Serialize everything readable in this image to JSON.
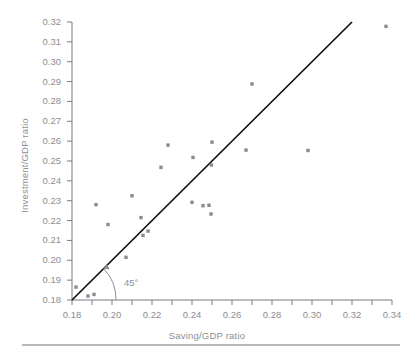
{
  "figure": {
    "background": "#ffffff",
    "point_color": "#8a8a96",
    "line_color": "#111111",
    "tick_color": "#7b7b83",
    "label_color": "#8e8e96",
    "rule_color": "#b9b9bd"
  },
  "annotation": {
    "angle_label": "45°"
  },
  "chart_data": {
    "type": "scatter",
    "title": "",
    "xlabel": "Saving/GDP ratio",
    "ylabel": "Investment/GDP ratio",
    "xlim": [
      0.18,
      0.34
    ],
    "ylim": [
      0.18,
      0.32
    ],
    "xticks": [
      0.18,
      0.19,
      0.2,
      0.21,
      0.22,
      0.23,
      0.24,
      0.25,
      0.26,
      0.27,
      0.28,
      0.29,
      0.3,
      0.31,
      0.32,
      0.33,
      0.34
    ],
    "xtick_labels": [
      "0.18",
      "",
      "0.20",
      "",
      "0.22",
      "",
      "0.24",
      "",
      "0.26",
      "",
      "0.28",
      "",
      "0.30",
      "",
      "0.32",
      "",
      "0.34"
    ],
    "yticks": [
      0.18,
      0.19,
      0.2,
      0.21,
      0.22,
      0.23,
      0.24,
      0.25,
      0.26,
      0.27,
      0.28,
      0.29,
      0.3,
      0.31,
      0.32
    ],
    "ytick_labels": [
      "0.18",
      "0.19",
      "0.20",
      "0.21",
      "0.22",
      "0.23",
      "0.24",
      "0.25",
      "0.26",
      "0.27",
      "0.28",
      "0.29",
      "0.30",
      "0.31",
      "0.32"
    ],
    "grid": false,
    "legend": null,
    "reference_line": {
      "label": "45°",
      "slope": 1,
      "intercept": 0,
      "x_start": 0.18,
      "y_start": 0.18,
      "x_end": 0.32,
      "y_end": 0.32
    },
    "points": [
      {
        "x": 0.182,
        "y": 0.1865
      },
      {
        "x": 0.188,
        "y": 0.182
      },
      {
        "x": 0.191,
        "y": 0.1828
      },
      {
        "x": 0.192,
        "y": 0.228
      },
      {
        "x": 0.198,
        "y": 0.218
      },
      {
        "x": 0.207,
        "y": 0.2015
      },
      {
        "x": 0.21,
        "y": 0.2325
      },
      {
        "x": 0.2145,
        "y": 0.2215
      },
      {
        "x": 0.2155,
        "y": 0.2125
      },
      {
        "x": 0.218,
        "y": 0.2147
      },
      {
        "x": 0.2245,
        "y": 0.2468
      },
      {
        "x": 0.228,
        "y": 0.258
      },
      {
        "x": 0.24,
        "y": 0.2292
      },
      {
        "x": 0.2405,
        "y": 0.2518
      },
      {
        "x": 0.2455,
        "y": 0.2275
      },
      {
        "x": 0.2485,
        "y": 0.2277
      },
      {
        "x": 0.2495,
        "y": 0.2233
      },
      {
        "x": 0.2497,
        "y": 0.248
      },
      {
        "x": 0.25,
        "y": 0.2595
      },
      {
        "x": 0.267,
        "y": 0.2555
      },
      {
        "x": 0.27,
        "y": 0.2888
      },
      {
        "x": 0.298,
        "y": 0.2553
      },
      {
        "x": 0.337,
        "y": 0.3178
      }
    ]
  }
}
